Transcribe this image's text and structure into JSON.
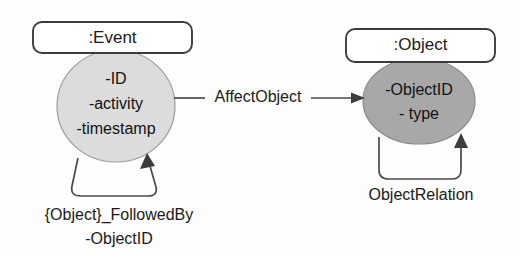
{
  "diagram": {
    "background_color": "#fdfdfd",
    "stroke_color": "#3c3c3c",
    "nodes": [
      {
        "id": "event",
        "box_label": ":Event",
        "shape": "rounded-rectangle-over-ellipse",
        "fill_color": "#dcdcdc",
        "attributes": [
          "-ID",
          "-activity",
          "-timestamp"
        ]
      },
      {
        "id": "object",
        "box_label": ":Object",
        "shape": "rounded-rectangle-over-ellipse",
        "fill_color": "#a8a8a8",
        "attributes": [
          "-ObjectID",
          "- type"
        ]
      }
    ],
    "edges": [
      {
        "id": "affect-object",
        "label": "AffectObject",
        "from": "event",
        "to": "object",
        "arrow": "filled-triangle",
        "direction": "right"
      }
    ],
    "self_loops": [
      {
        "id": "followed-by",
        "on": "event",
        "label_line1": "{Object}_FollowedBy",
        "label_line2": "-ObjectID",
        "arrow": "filled-triangle"
      },
      {
        "id": "object-relation",
        "on": "object",
        "label_line1": "ObjectRelation",
        "label_line2": "",
        "arrow": "filled-triangle"
      }
    ]
  }
}
